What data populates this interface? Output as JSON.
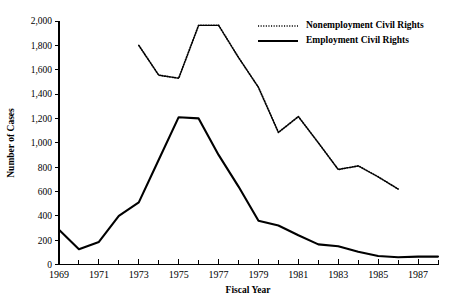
{
  "chart_data": {
    "type": "line",
    "title": "",
    "xlabel": "Fiscal Year",
    "ylabel": "Number of Cases",
    "xlim": [
      1969,
      1988
    ],
    "ylim": [
      0,
      2000
    ],
    "grid": false,
    "legend_position": "top-right",
    "x": [
      1969,
      1970,
      1971,
      1972,
      1973,
      1974,
      1975,
      1976,
      1977,
      1978,
      1979,
      1980,
      1981,
      1982,
      1983,
      1984,
      1985,
      1986,
      1987,
      1988
    ],
    "xtick_labels": [
      "1969",
      "1971",
      "1973",
      "1975",
      "1977",
      "1979",
      "1981",
      "1983",
      "1985",
      "1987"
    ],
    "xtick_values": [
      1969,
      1971,
      1973,
      1975,
      1977,
      1979,
      1981,
      1983,
      1985,
      1987
    ],
    "ytick_labels": [
      "0",
      "200",
      "400",
      "600",
      "800",
      "1,000",
      "1,200",
      "1,400",
      "1,600",
      "1,800",
      "2,000"
    ],
    "ytick_values": [
      0,
      200,
      400,
      600,
      800,
      1000,
      1200,
      1400,
      1600,
      1800,
      2000
    ],
    "series": [
      {
        "name": "Nonemployment Civil Rights",
        "style": "dotted",
        "color": "#000000",
        "x": [
          1973,
          1974,
          1975,
          1976,
          1977,
          1978,
          1979,
          1980,
          1981,
          1982,
          1983,
          1984,
          1985,
          1986
        ],
        "values": [
          1800,
          1555,
          1530,
          1965,
          1965,
          1700,
          1455,
          1085,
          1215,
          1000,
          780,
          810,
          720,
          620
        ]
      },
      {
        "name": "Employment Civil Rights",
        "style": "solid",
        "color": "#000000",
        "x": [
          1969,
          1970,
          1971,
          1972,
          1973,
          1974,
          1975,
          1976,
          1977,
          1978,
          1979,
          1980,
          1981,
          1982,
          1983,
          1984,
          1985,
          1986,
          1987,
          1988
        ],
        "values": [
          285,
          125,
          185,
          400,
          510,
          860,
          1210,
          1200,
          900,
          640,
          360,
          320,
          240,
          165,
          150,
          105,
          70,
          60,
          65,
          65
        ]
      }
    ]
  },
  "legend": {
    "items": [
      {
        "label": "Nonemployment Civil Rights",
        "style": "dotted"
      },
      {
        "label": "Employment Civil Rights",
        "style": "solid"
      }
    ]
  },
  "axes": {
    "x_title": "Fiscal Year",
    "y_title": "Number of Cases"
  }
}
